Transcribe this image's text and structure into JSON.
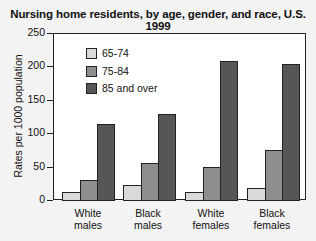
{
  "chart_data": {
    "type": "bar",
    "title": "Nursing home residents, by age, gender, and race, U.S. 1999",
    "xlabel": "",
    "ylabel": "Rates per 1000 population",
    "ylim": [
      0,
      250
    ],
    "yticks": [
      "0",
      "50",
      "100",
      "150",
      "200",
      "250"
    ],
    "grid": false,
    "legend_position": "upper-left inside",
    "categories": [
      "White males",
      "Black males",
      "White females",
      "Black females"
    ],
    "category_lines": [
      [
        "White",
        "males"
      ],
      [
        "Black",
        "males"
      ],
      [
        "White",
        "females"
      ],
      [
        "Black",
        "females"
      ]
    ],
    "series": [
      {
        "name": "65-74",
        "color": "#d9d9d9",
        "values": [
          12,
          22,
          12,
          18
        ]
      },
      {
        "name": "75-84",
        "color": "#8e8e8e",
        "values": [
          30,
          55,
          49,
          75
        ]
      },
      {
        "name": "85 and over",
        "color": "#565656",
        "values": [
          114,
          128,
          208,
          204
        ]
      }
    ]
  }
}
